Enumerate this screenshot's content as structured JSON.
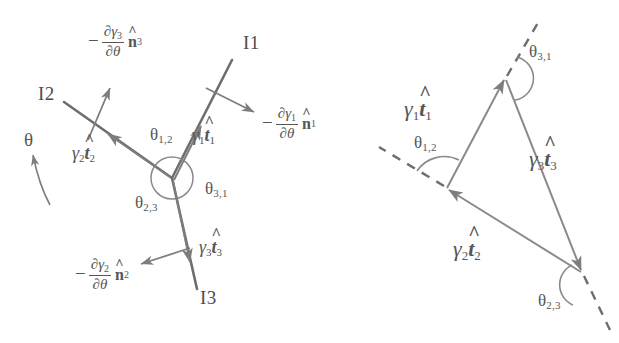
{
  "figure": {
    "stroke_color": "#808080",
    "interface_color": "#6e6e6e",
    "text_color": "#565656",
    "width": 619,
    "height": 343
  },
  "left_diagram": {
    "name": "triple-junction-diagram",
    "junction": {
      "x": 172,
      "y": 178
    },
    "circle_radius": 21,
    "interfaces": [
      {
        "id": "I1",
        "label": "I1",
        "label_x": 243,
        "label_y": 40,
        "from": [
          172,
          178
        ],
        "to": [
          231,
          61
        ]
      },
      {
        "id": "I2",
        "label": "I2",
        "label_x": 38,
        "label_y": 90,
        "from": [
          172,
          178
        ],
        "to": [
          65,
          103
        ]
      },
      {
        "id": "I3",
        "label": "I3",
        "label_x": 200,
        "label_y": 296,
        "from": [
          172,
          178
        ],
        "to": [
          196,
          288
        ]
      }
    ],
    "tangent_vectors": [
      {
        "id": "g1t1",
        "gamma": "γ",
        "sub": "1",
        "t": "t",
        "hat": "^",
        "x": 196,
        "y": 133
      },
      {
        "id": "g2t2",
        "gamma": "γ",
        "sub": "2",
        "t": "t",
        "hat": "^",
        "x": 78,
        "y": 151
      },
      {
        "id": "g3t3",
        "gamma": "γ",
        "sub": "3",
        "t": "t",
        "hat": "^",
        "x": 203,
        "y": 245
      }
    ],
    "normal_vectors": [
      {
        "id": "n1",
        "minus": "−",
        "num_partial": "∂",
        "num_gamma": "γ",
        "num_sub": "1",
        "den_partial": "∂",
        "den_theta": "θ",
        "n": "n",
        "n_sub": "1",
        "x": 271,
        "y": 113
      },
      {
        "id": "n2",
        "minus": "−",
        "num_partial": "∂",
        "num_gamma": "γ",
        "num_sub": "2",
        "den_partial": "∂",
        "den_theta": "θ",
        "n": "n",
        "n_sub": "2",
        "x": 83,
        "y": 264
      },
      {
        "id": "n3",
        "minus": "−",
        "num_partial": "∂",
        "num_gamma": "γ",
        "num_sub": "3",
        "den_partial": "∂",
        "den_theta": "θ",
        "n": "n",
        "n_sub": "3",
        "x": 96,
        "y": 31
      }
    ],
    "angles": [
      {
        "id": "theta12",
        "theta": "θ",
        "sub": "1,2",
        "x": 155,
        "y": 134
      },
      {
        "id": "theta31",
        "theta": "θ",
        "sub": "3,1",
        "x": 209,
        "y": 188
      },
      {
        "id": "theta23",
        "theta": "θ",
        "sub": "2,3",
        "x": 140,
        "y": 202
      }
    ],
    "orientation_label": {
      "id": "theta",
      "text": "θ",
      "x": 26,
      "y": 136
    }
  },
  "right_diagram": {
    "name": "closure-triangle-diagram",
    "vertices": {
      "top": [
        505,
        78
      ],
      "left": [
        447,
        188
      ],
      "bottom_right": [
        582,
        272
      ]
    },
    "tangent_vectors": [
      {
        "id": "g1t1",
        "gamma": "γ",
        "sub": "1",
        "t": "t",
        "hat": "^",
        "x": 414,
        "y": 108
      },
      {
        "id": "g3t3",
        "gamma": "γ",
        "sub": "3",
        "t": "t",
        "hat": "^",
        "x": 537,
        "y": 158
      },
      {
        "id": "g2t2",
        "gamma": "γ",
        "sub": "2",
        "t": "t",
        "hat": "^",
        "x": 462,
        "y": 248
      }
    ],
    "angles": [
      {
        "id": "theta31",
        "theta": "θ",
        "sub": "3,1",
        "x": 531,
        "y": 51
      },
      {
        "id": "theta12",
        "theta": "θ",
        "sub": "1,2",
        "x": 419,
        "y": 142
      },
      {
        "id": "theta23",
        "theta": "θ",
        "sub": "2,3",
        "x": 543,
        "y": 300
      }
    ]
  }
}
